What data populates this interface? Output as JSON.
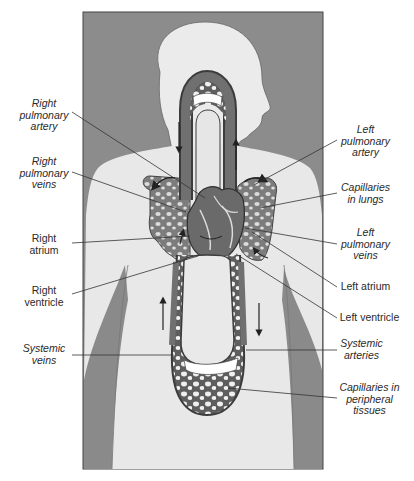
{
  "diagram": {
    "title": "",
    "colors": {
      "frame_background": "#8c8c8c",
      "body_silhouette": "#e9e9e9",
      "vessel": "#6e6e6e",
      "vessel_outline": "#3a3a3a",
      "lung_fill": "#8a8a8a",
      "label_text": "#2a2a2a",
      "leader_line": "#333333"
    },
    "labels_left": [
      {
        "id": "right-pulmonary-artery",
        "text": "Right\npulmonary\nartery",
        "italic": true
      },
      {
        "id": "right-pulmonary-veins",
        "text": "Right\npulmonary\nveins",
        "italic": true
      },
      {
        "id": "right-atrium",
        "text": "Right\natrium",
        "italic": false
      },
      {
        "id": "right-ventricle",
        "text": "Right\nventricle",
        "italic": false
      },
      {
        "id": "systemic-veins",
        "text": "Systemic\nveins",
        "italic": true
      }
    ],
    "labels_right": [
      {
        "id": "left-pulmonary-artery",
        "text": "Left\npulmonary\nartery",
        "italic": true
      },
      {
        "id": "capillaries-in-lungs",
        "text": "Capillaries\nin lungs",
        "italic": true
      },
      {
        "id": "left-pulmonary-veins",
        "text": "Left\npulmonary\nveins",
        "italic": true
      },
      {
        "id": "left-atrium",
        "text": "Left atrium",
        "italic": false
      },
      {
        "id": "left-ventricle",
        "text": "Left ventricle",
        "italic": false
      },
      {
        "id": "systemic-arteries",
        "text": "Systemic\narteries",
        "italic": true
      },
      {
        "id": "capillaries-in-peripheral-tissues",
        "text": "Capillaries in\nperipheral\ntissues",
        "italic": true
      }
    ],
    "flow_arrows": [
      {
        "location": "pulmonary-loop-left",
        "direction": "down"
      },
      {
        "location": "pulmonary-loop-right",
        "direction": "up"
      },
      {
        "location": "systemic-loop-left",
        "direction": "up"
      },
      {
        "location": "systemic-loop-right",
        "direction": "down"
      },
      {
        "location": "right-lung-top",
        "direction": "curved-left"
      },
      {
        "location": "left-lung-top",
        "direction": "curved-right"
      }
    ]
  }
}
